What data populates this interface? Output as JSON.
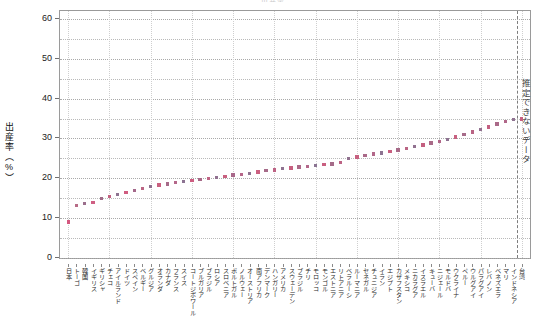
{
  "title": "出産率",
  "axes": {
    "ylabel": "出産率（%）",
    "yticks": [
      0,
      10,
      20,
      30,
      40,
      50,
      60
    ],
    "yminor": [
      5,
      15,
      25,
      35,
      45,
      55
    ],
    "ylim": [
      0,
      62
    ],
    "annotation": "推定できないデータ"
  },
  "chart_data": {
    "type": "scatter",
    "title": "出産率",
    "xlabel": "",
    "ylabel": "出産率（%）",
    "ylim": [
      0,
      62
    ],
    "grid": true,
    "legend": null,
    "annotations": [
      {
        "text": "推定できないデータ",
        "x_category": "台湾",
        "orientation": "vertical"
      }
    ],
    "categories": [
      "日本",
      "トーゴ",
      "韓国",
      "イギリス",
      "ギリシャ",
      "チェコ",
      "アイルランド",
      "ドイツ",
      "スペイン",
      "ベルギー",
      "グルジア",
      "オランダ",
      "カナダ",
      "フランス",
      "スイス",
      "コートジボワール",
      "ブルガリア",
      "ブラジル",
      "ロシア",
      "スロベニア",
      "ポルトガル",
      "ノルウェー",
      "オーストリア",
      "南アフリカ",
      "デンマーク",
      "ハンガリー",
      "アメリカ",
      "スウェーデン",
      "ブラジル",
      "チリ",
      "モロッコ",
      "モンゴル",
      "エストニア",
      "リトアニア",
      "ベラルーシ",
      "ルーマニア",
      "セネガル",
      "チュニジア",
      "イラン",
      "エジプト",
      "カザフスタン",
      "メキシコ",
      "ニカラグア",
      "イスラエル",
      "キューバ",
      "ニジェール",
      "モルドバ",
      "ウクライナ",
      "ペルー",
      "ウルグアイ",
      "パラグアイ",
      "レバノン",
      "ベネズエラ",
      "マリ",
      "インドネシア",
      "台湾"
    ],
    "values": [
      9.0,
      13.2,
      13.7,
      14.0,
      15.0,
      15.4,
      16.0,
      16.4,
      17.0,
      17.5,
      17.9,
      18.3,
      18.6,
      18.9,
      19.2,
      19.4,
      19.7,
      20.0,
      20.2,
      20.5,
      20.8,
      21.0,
      21.2,
      21.6,
      21.9,
      22.1,
      22.4,
      22.6,
      22.8,
      23.0,
      23.2,
      23.4,
      23.6,
      23.9,
      25.0,
      25.4,
      25.8,
      26.1,
      26.4,
      26.8,
      27.1,
      27.5,
      28.0,
      28.4,
      28.9,
      29.3,
      29.8,
      30.4,
      31.0,
      31.6,
      32.2,
      32.9,
      33.6,
      34.3,
      34.7,
      34.9
    ],
    "marker_colors": [
      "#d4577f",
      "#b76b86",
      "#9b6f8c",
      "#cf5f83",
      "#a06a87",
      "#c2607f",
      "#8e7390",
      "#d05c80",
      "#a4688a",
      "#bb6484",
      "#8f7190",
      "#c9607f",
      "#a66a88",
      "#b4678a",
      "#8c7392",
      "#cd5e81",
      "#a76a88",
      "#bf6384",
      "#917190",
      "#c8607f",
      "#a8688a",
      "#b56689",
      "#8d7391",
      "#cb5f80",
      "#a66b89",
      "#bd6384",
      "#8f7290",
      "#c75f80",
      "#ab6988",
      "#b3678a",
      "#8b7492",
      "#c95f80",
      "#a56b89",
      "#bc6384",
      "#90718f",
      "#c6607f",
      "#aa6988",
      "#b26789",
      "#8d7391",
      "#c85f80",
      "#a76a88",
      "#ba6484",
      "#917190",
      "#c45f80",
      "#a96a88",
      "#b16789",
      "#8e7291",
      "#c76080",
      "#a66b89",
      "#b96484",
      "#927190",
      "#c35f81",
      "#aa6988",
      "#b06789",
      "#8f7291",
      "#c66080"
    ]
  }
}
